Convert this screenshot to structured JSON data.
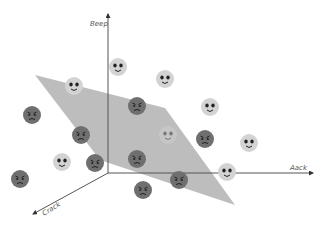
{
  "diagram": {
    "title": "",
    "type": "3d-hyperplane-classifier",
    "axes": {
      "y": {
        "label": "Beep",
        "direction": "up"
      },
      "x": {
        "label": "Aack",
        "direction": "right"
      },
      "z": {
        "label": "Crack",
        "direction": "down-left"
      }
    },
    "colors": {
      "plane": "#bdbdbd",
      "axis": "#555555",
      "happy_face": "#d3d3d3",
      "sad_face": "#6f6f6f",
      "face_features": "#222222"
    },
    "plane": {
      "points": [
        [
          35,
          75
        ],
        [
          165,
          108
        ],
        [
          235,
          205
        ],
        [
          100,
          160
        ]
      ],
      "description": "separating hyperplane"
    },
    "faces": [
      {
        "type": "happy",
        "x": 74,
        "y": 86,
        "side": "above"
      },
      {
        "type": "happy",
        "x": 118,
        "y": 67,
        "side": "above"
      },
      {
        "type": "happy",
        "x": 165,
        "y": 79,
        "side": "above"
      },
      {
        "type": "happy",
        "x": 210,
        "y": 107,
        "side": "above"
      },
      {
        "type": "happy",
        "x": 249,
        "y": 143,
        "side": "above"
      },
      {
        "type": "happy",
        "x": 62,
        "y": 162,
        "side": "above"
      },
      {
        "type": "happy",
        "x": 227,
        "y": 172,
        "side": "above"
      },
      {
        "type": "happy",
        "x": 168,
        "y": 135,
        "side": "behind-plane"
      },
      {
        "type": "sad",
        "x": 32,
        "y": 115,
        "side": "below"
      },
      {
        "type": "sad",
        "x": 137,
        "y": 106,
        "side": "below"
      },
      {
        "type": "sad",
        "x": 81,
        "y": 135,
        "side": "below"
      },
      {
        "type": "sad",
        "x": 95,
        "y": 163,
        "side": "below"
      },
      {
        "type": "sad",
        "x": 137,
        "y": 159,
        "side": "below"
      },
      {
        "type": "sad",
        "x": 205,
        "y": 139,
        "side": "below"
      },
      {
        "type": "sad",
        "x": 20,
        "y": 179,
        "side": "below"
      },
      {
        "type": "sad",
        "x": 179,
        "y": 180,
        "side": "below"
      },
      {
        "type": "sad",
        "x": 143,
        "y": 190,
        "side": "below"
      }
    ]
  }
}
